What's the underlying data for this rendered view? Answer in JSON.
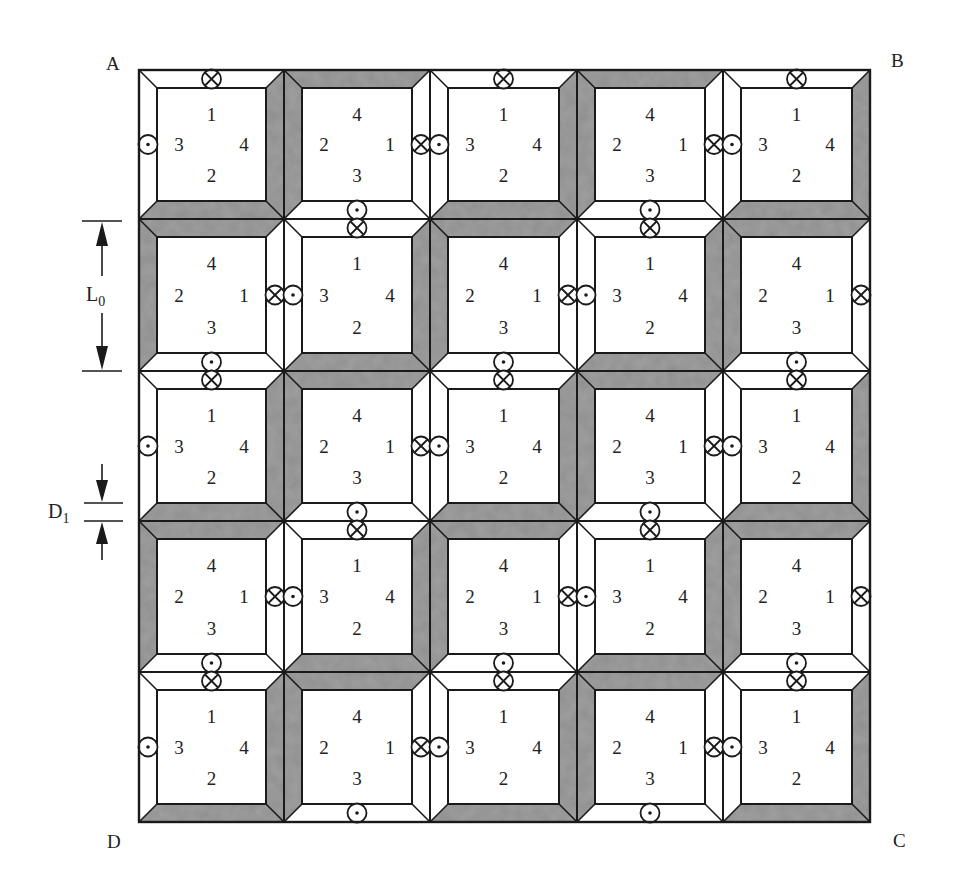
{
  "figure": {
    "corners": {
      "A": "A",
      "B": "B",
      "C": "C",
      "D": "D"
    },
    "dimensions": {
      "L0": {
        "label": "L",
        "subscript": "0"
      },
      "D1": {
        "label": "D",
        "subscript": "1"
      }
    },
    "grid": {
      "rows": 5,
      "cols": 5
    },
    "colors": {
      "bevel_gray": "#8f8f8f",
      "line": "#1a1a1a",
      "background": "#ffffff"
    },
    "cell_types": {
      "A": {
        "top": "1",
        "left": "3",
        "right": "4",
        "bottom": "2",
        "bevel": "gray bottom-right",
        "symbols": [
          "dot-left",
          "cross-top"
        ]
      },
      "B": {
        "top": "4",
        "left": "2",
        "right": "1",
        "bottom": "3",
        "bevel": "gray top-left",
        "symbols": [
          "cross-right",
          "dot-bottom"
        ]
      }
    },
    "layout": [
      [
        "A",
        "B",
        "A",
        "B",
        "A"
      ],
      [
        "B",
        "A",
        "B",
        "A",
        "B"
      ],
      [
        "A",
        "B",
        "A",
        "B",
        "A"
      ],
      [
        "B",
        "A",
        "B",
        "A",
        "B"
      ],
      [
        "A",
        "B",
        "A",
        "B",
        "A"
      ]
    ]
  }
}
